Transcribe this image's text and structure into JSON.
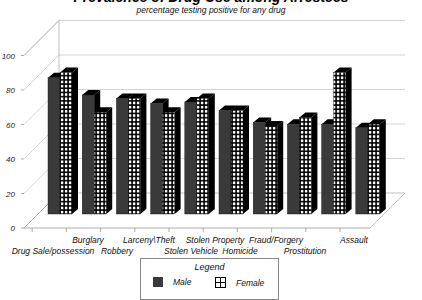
{
  "chart_data": {
    "type": "bar",
    "title": "Prevalence of Drug Use among Arrestees",
    "subtitle": "percentage testing positive for any drug",
    "xlabel": "",
    "ylabel": "",
    "ylim": [
      0,
      100
    ],
    "yticks": [
      0,
      20,
      40,
      60,
      80,
      100
    ],
    "grid": true,
    "three_d": true,
    "legend_position": "bottom",
    "categories": [
      "Drug Sale/possession",
      "Burglary",
      "Robbery",
      "Larceny\\Theft",
      "Stolen Vehicle",
      "Stolen Property",
      "Homicide",
      "Fraud/Forgery",
      "Prostitution",
      "Assault"
    ],
    "series": [
      {
        "name": "Male",
        "pattern": "solid",
        "color": "#3a3a3a",
        "values": [
          79,
          69,
          67,
          64,
          65,
          60,
          53,
          52,
          52,
          50
        ]
      },
      {
        "name": "Female",
        "pattern": "grid",
        "color": "#ffffff",
        "values": [
          82,
          59,
          67,
          59,
          67,
          60,
          51,
          56,
          82,
          52
        ]
      }
    ]
  },
  "legend": {
    "title": "Legend",
    "items": [
      {
        "label": "Male",
        "icon": "solid-square-icon"
      },
      {
        "label": "Female",
        "icon": "grid-square-icon"
      }
    ]
  }
}
